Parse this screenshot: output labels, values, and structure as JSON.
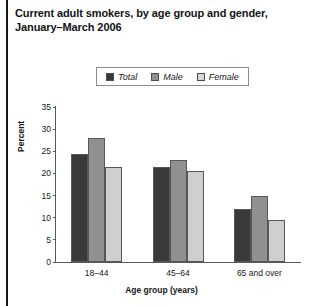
{
  "figure": {
    "title_lines": [
      "Current adult smokers, by age group and gender,",
      "January–March 2006"
    ]
  },
  "chart_data": {
    "type": "bar",
    "title": "Current adult smokers, by age group and gender, January–March 2006",
    "xlabel": "Age group (years)",
    "ylabel": "Percent",
    "categories": [
      "18–44",
      "45–64",
      "65 and over"
    ],
    "series": [
      {
        "name": "Total",
        "values": [
          24.5,
          21.5,
          12.0
        ],
        "color": "#3a3a3a"
      },
      {
        "name": "Male",
        "values": [
          28.0,
          23.0,
          15.0
        ],
        "color": "#909090"
      },
      {
        "name": "Female",
        "values": [
          21.5,
          20.5,
          9.5
        ],
        "color": "#cfcfcf"
      }
    ],
    "ylim": [
      0,
      35
    ],
    "yticks": [
      0,
      5,
      10,
      15,
      20,
      25,
      30,
      35
    ],
    "ytick_labels": [
      "0",
      "5",
      "10",
      "15",
      "20",
      "25",
      "30",
      "35"
    ],
    "grid": false,
    "legend_position": "top-center",
    "legend_entries": [
      "Total",
      "Male",
      "Female"
    ]
  }
}
